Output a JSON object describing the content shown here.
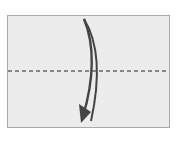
{
  "diagram": {
    "type": "origami-fold-step",
    "paper": {
      "fill": "#ececec",
      "border": "#a8a8a8"
    },
    "fold_line": {
      "style": "dashed",
      "orientation": "horizontal",
      "color": "#666666"
    },
    "arrow": {
      "direction": "down",
      "shape": "curved",
      "color": "#444444"
    }
  }
}
